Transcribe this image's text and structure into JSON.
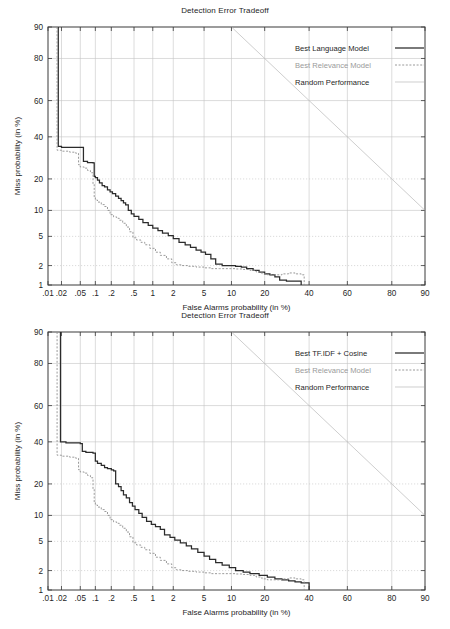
{
  "figure": {
    "panels": [
      {
        "id": "top",
        "title": "Detection Error Tradeoff",
        "xlabel": "False Alarms probability (in %)",
        "ylabel": "Miss probability (in %)",
        "legend": [
          {
            "label": "Best Language Model",
            "style": "solid",
            "color": "#2b2b2b",
            "muted": false
          },
          {
            "label": "Best Relevance Model",
            "style": "dashed",
            "color": "#8f8f8f",
            "muted": true
          },
          {
            "label": "Random Performance",
            "style": "thin",
            "color": "#b9b9b9",
            "muted": false
          }
        ]
      },
      {
        "id": "bottom",
        "title": "Detection Error Tradeoff",
        "xlabel": "False Alarms probability (in %)",
        "ylabel": "Miss probability (in %)",
        "legend": [
          {
            "label": "Best TF.IDF + Cosine",
            "style": "solid",
            "color": "#2b2b2b",
            "muted": false
          },
          {
            "label": "Best Relevance Model",
            "style": "dashed",
            "color": "#8f8f8f",
            "muted": true
          },
          {
            "label": "Random Performance",
            "style": "thin",
            "color": "#b9b9b9",
            "muted": false
          }
        ]
      }
    ]
  },
  "chart_data": [
    {
      "type": "line",
      "id": "top",
      "title": "Detection Error Tradeoff",
      "xlabel": "False Alarms probability (in %)",
      "ylabel": "Miss probability (in %)",
      "scale": "normal-deviate",
      "xlim": [
        0.01,
        90
      ],
      "ylim": [
        1,
        90
      ],
      "grid": true,
      "legend_position": "top-right",
      "xticks": [
        0.01,
        0.02,
        0.05,
        0.1,
        0.2,
        0.5,
        1,
        2,
        5,
        10,
        20,
        40,
        60,
        80,
        90
      ],
      "xticklabels": [
        ".01",
        ".02",
        ".05",
        ".1",
        ".2",
        ".5",
        "1",
        "2",
        "5",
        "10",
        "20",
        "40",
        "60",
        "80",
        "90"
      ],
      "yticks": [
        1,
        2,
        5,
        10,
        20,
        40,
        60,
        80,
        90
      ],
      "yticklabels": [
        "1",
        "2",
        "5",
        "10",
        "20",
        "40",
        "60",
        "80",
        "90"
      ],
      "series": [
        {
          "name": "Best Language Model",
          "style": "solid",
          "color": "#2b2b2b",
          "points": [
            [
              0.017,
              90
            ],
            [
              0.017,
              35
            ],
            [
              0.02,
              34.5
            ],
            [
              0.03,
              34.5
            ],
            [
              0.045,
              34.5
            ],
            [
              0.05,
              34.5
            ],
            [
              0.055,
              34.5
            ],
            [
              0.058,
              27.5
            ],
            [
              0.07,
              27.0
            ],
            [
              0.08,
              27.0
            ],
            [
              0.09,
              26.8
            ],
            [
              0.095,
              21.0
            ],
            [
              0.1,
              20.5
            ],
            [
              0.11,
              19.5
            ],
            [
              0.12,
              18.5
            ],
            [
              0.135,
              17.5
            ],
            [
              0.15,
              17.0
            ],
            [
              0.17,
              16.0
            ],
            [
              0.19,
              15.3
            ],
            [
              0.21,
              14.8
            ],
            [
              0.24,
              14.0
            ],
            [
              0.27,
              13.3
            ],
            [
              0.3,
              12.6
            ],
            [
              0.33,
              12.0
            ],
            [
              0.36,
              11.4
            ],
            [
              0.4,
              10.0
            ],
            [
              0.45,
              9.2
            ],
            [
              0.5,
              8.6
            ],
            [
              0.6,
              8.0
            ],
            [
              0.7,
              7.3
            ],
            [
              0.85,
              6.8
            ],
            [
              1.0,
              6.3
            ],
            [
              1.2,
              5.9
            ],
            [
              1.4,
              5.5
            ],
            [
              1.7,
              5.1
            ],
            [
              2.0,
              4.7
            ],
            [
              2.4,
              4.2
            ],
            [
              2.9,
              3.9
            ],
            [
              3.4,
              3.6
            ],
            [
              4.0,
              3.3
            ],
            [
              4.6,
              3.1
            ],
            [
              5.2,
              2.9
            ],
            [
              6.0,
              2.5
            ],
            [
              6.8,
              2.1
            ],
            [
              8.0,
              2.0
            ],
            [
              9.5,
              2.0
            ],
            [
              11.0,
              1.95
            ],
            [
              12.5,
              1.9
            ],
            [
              14.0,
              1.8
            ],
            [
              16.0,
              1.7
            ],
            [
              18.0,
              1.6
            ],
            [
              20.0,
              1.5
            ],
            [
              22.0,
              1.45
            ],
            [
              24.0,
              1.35
            ],
            [
              26.0,
              1.2
            ],
            [
              29.0,
              1.15
            ],
            [
              32.0,
              1.15
            ],
            [
              35.0,
              1.15
            ],
            [
              36.0,
              1.0
            ]
          ]
        },
        {
          "name": "Best Relevance Model",
          "style": "dashed",
          "color": "#8f8f8f",
          "points": [
            [
              0.016,
              90
            ],
            [
              0.016,
              33
            ],
            [
              0.02,
              32.5
            ],
            [
              0.03,
              32.0
            ],
            [
              0.04,
              31.5
            ],
            [
              0.046,
              26.0
            ],
            [
              0.05,
              25.0
            ],
            [
              0.06,
              24.5
            ],
            [
              0.07,
              23.5
            ],
            [
              0.08,
              22.5
            ],
            [
              0.09,
              18.0
            ],
            [
              0.095,
              13.5
            ],
            [
              0.1,
              12.8
            ],
            [
              0.11,
              12.2
            ],
            [
              0.13,
              11.5
            ],
            [
              0.15,
              11.0
            ],
            [
              0.17,
              10.0
            ],
            [
              0.19,
              9.0
            ],
            [
              0.22,
              8.5
            ],
            [
              0.25,
              8.2
            ],
            [
              0.28,
              7.8
            ],
            [
              0.32,
              7.2
            ],
            [
              0.37,
              6.5
            ],
            [
              0.42,
              5.7
            ],
            [
              0.48,
              4.8
            ],
            [
              0.55,
              4.5
            ],
            [
              0.65,
              4.2
            ],
            [
              0.75,
              3.9
            ],
            [
              0.9,
              3.5
            ],
            [
              1.1,
              3.1
            ],
            [
              1.3,
              2.8
            ],
            [
              1.6,
              2.5
            ],
            [
              1.9,
              2.2
            ],
            [
              2.2,
              2.05
            ],
            [
              2.6,
              2.0
            ],
            [
              3.2,
              1.95
            ],
            [
              4.0,
              1.9
            ],
            [
              5.0,
              1.85
            ],
            [
              6.0,
              1.8
            ],
            [
              7.5,
              1.8
            ],
            [
              9.0,
              1.8
            ],
            [
              11.0,
              1.78
            ],
            [
              13.0,
              1.75
            ],
            [
              15.0,
              1.7
            ],
            [
              17.0,
              1.6
            ],
            [
              19.0,
              1.5
            ],
            [
              21.0,
              1.45
            ],
            [
              24.0,
              1.45
            ],
            [
              27.0,
              1.5
            ],
            [
              30.0,
              1.55
            ],
            [
              33.0,
              1.5
            ],
            [
              36.0,
              1.45
            ],
            [
              37.5,
              1.0
            ]
          ]
        },
        {
          "name": "Random Performance",
          "style": "thin",
          "color": "#b9b9b9",
          "points": [
            [
              10,
              90
            ],
            [
              90,
              10
            ]
          ]
        }
      ]
    },
    {
      "type": "line",
      "id": "bottom",
      "title": "Detection Error Tradeoff",
      "xlabel": "False Alarms probability (in %)",
      "ylabel": "Miss probability (in %)",
      "scale": "normal-deviate",
      "xlim": [
        0.01,
        90
      ],
      "ylim": [
        1,
        90
      ],
      "grid": true,
      "legend_position": "top-right",
      "xticks": [
        0.01,
        0.02,
        0.05,
        0.1,
        0.2,
        0.5,
        1,
        2,
        5,
        10,
        20,
        40,
        60,
        80,
        90
      ],
      "xticklabels": [
        ".01",
        ".02",
        ".05",
        ".1",
        ".2",
        ".5",
        "1",
        "2",
        "5",
        "10",
        "20",
        "40",
        "60",
        "80",
        "90"
      ],
      "yticks": [
        1,
        2,
        5,
        10,
        20,
        40,
        60,
        80,
        90
      ],
      "yticklabels": [
        "1",
        "2",
        "5",
        "10",
        "20",
        "40",
        "60",
        "80",
        "90"
      ],
      "series": [
        {
          "name": "Best TF.IDF + Cosine",
          "style": "solid",
          "color": "#2b2b2b",
          "points": [
            [
              0.019,
              90
            ],
            [
              0.019,
              40
            ],
            [
              0.025,
              39.5
            ],
            [
              0.035,
              39.5
            ],
            [
              0.045,
              39.5
            ],
            [
              0.05,
              39.0
            ],
            [
              0.055,
              35.0
            ],
            [
              0.065,
              34.5
            ],
            [
              0.08,
              34.5
            ],
            [
              0.09,
              34.0
            ],
            [
              0.1,
              30.0
            ],
            [
              0.11,
              29.0
            ],
            [
              0.13,
              28.0
            ],
            [
              0.15,
              27.0
            ],
            [
              0.17,
              26.5
            ],
            [
              0.2,
              26.0
            ],
            [
              0.22,
              25.5
            ],
            [
              0.24,
              20.0
            ],
            [
              0.27,
              19.0
            ],
            [
              0.3,
              17.5
            ],
            [
              0.33,
              16.0
            ],
            [
              0.37,
              15.0
            ],
            [
              0.42,
              13.5
            ],
            [
              0.47,
              12.5
            ],
            [
              0.52,
              11.5
            ],
            [
              0.6,
              10.5
            ],
            [
              0.68,
              9.5
            ],
            [
              0.8,
              8.6
            ],
            [
              0.95,
              8.0
            ],
            [
              1.1,
              7.5
            ],
            [
              1.3,
              7.0
            ],
            [
              1.5,
              6.0
            ],
            [
              1.8,
              5.6
            ],
            [
              2.1,
              5.2
            ],
            [
              2.5,
              4.8
            ],
            [
              3.0,
              4.4
            ],
            [
              3.5,
              4.0
            ],
            [
              4.2,
              3.6
            ],
            [
              5.0,
              3.2
            ],
            [
              5.8,
              2.9
            ],
            [
              6.8,
              2.6
            ],
            [
              8.0,
              2.4
            ],
            [
              9.5,
              2.2
            ],
            [
              11.0,
              2.0
            ],
            [
              13.0,
              1.9
            ],
            [
              15.0,
              1.8
            ],
            [
              18.0,
              1.7
            ],
            [
              21.0,
              1.6
            ],
            [
              24.0,
              1.5
            ],
            [
              27.0,
              1.45
            ],
            [
              30.0,
              1.4
            ],
            [
              33.0,
              1.35
            ],
            [
              36.0,
              1.3
            ],
            [
              39.0,
              1.3
            ],
            [
              40.0,
              1.0
            ]
          ]
        },
        {
          "name": "Best Relevance Model",
          "style": "dashed",
          "color": "#8f8f8f",
          "points": [
            [
              0.016,
              90
            ],
            [
              0.016,
              33
            ],
            [
              0.02,
              32.5
            ],
            [
              0.03,
              32.0
            ],
            [
              0.04,
              31.5
            ],
            [
              0.046,
              26.0
            ],
            [
              0.05,
              25.0
            ],
            [
              0.06,
              24.5
            ],
            [
              0.07,
              23.5
            ],
            [
              0.08,
              22.5
            ],
            [
              0.09,
              18.0
            ],
            [
              0.095,
              13.5
            ],
            [
              0.1,
              12.8
            ],
            [
              0.11,
              12.2
            ],
            [
              0.13,
              11.5
            ],
            [
              0.15,
              11.0
            ],
            [
              0.17,
              10.0
            ],
            [
              0.19,
              9.0
            ],
            [
              0.22,
              8.5
            ],
            [
              0.25,
              8.2
            ],
            [
              0.28,
              7.8
            ],
            [
              0.32,
              7.2
            ],
            [
              0.37,
              6.5
            ],
            [
              0.42,
              5.7
            ],
            [
              0.48,
              4.8
            ],
            [
              0.55,
              4.5
            ],
            [
              0.65,
              4.2
            ],
            [
              0.75,
              3.9
            ],
            [
              0.9,
              3.5
            ],
            [
              1.1,
              3.1
            ],
            [
              1.3,
              2.8
            ],
            [
              1.6,
              2.5
            ],
            [
              1.9,
              2.2
            ],
            [
              2.2,
              2.05
            ],
            [
              2.6,
              2.0
            ],
            [
              3.2,
              1.95
            ],
            [
              4.0,
              1.9
            ],
            [
              5.0,
              1.85
            ],
            [
              6.0,
              1.8
            ],
            [
              7.5,
              1.8
            ],
            [
              9.0,
              1.8
            ],
            [
              11.0,
              1.78
            ],
            [
              13.0,
              1.75
            ],
            [
              15.0,
              1.7
            ],
            [
              17.0,
              1.6
            ],
            [
              19.0,
              1.5
            ],
            [
              21.0,
              1.45
            ],
            [
              24.0,
              1.45
            ],
            [
              27.0,
              1.5
            ],
            [
              30.0,
              1.55
            ],
            [
              33.0,
              1.5
            ],
            [
              36.0,
              1.45
            ],
            [
              37.5,
              1.0
            ]
          ]
        },
        {
          "name": "Random Performance",
          "style": "thin",
          "color": "#b9b9b9",
          "points": [
            [
              10,
              90
            ],
            [
              90,
              10
            ]
          ]
        }
      ]
    }
  ]
}
